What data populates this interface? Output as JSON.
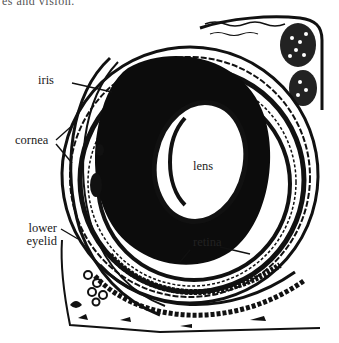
{
  "caption_fragment": "es and vision.",
  "diagram": {
    "labels": {
      "iris": "iris",
      "cornea": "cornea",
      "lens": "lens",
      "lower_eyelid_line1": "lower",
      "lower_eyelid_line2": "eyelid",
      "retina": "retina"
    },
    "colors": {
      "ink": "#111111",
      "paper": "#ffffff"
    }
  }
}
